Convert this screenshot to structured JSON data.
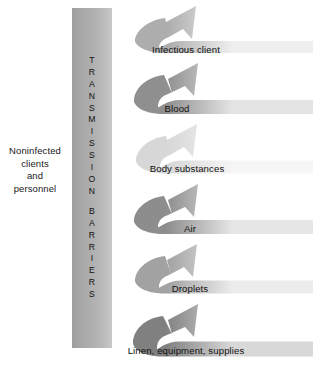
{
  "figure": {
    "type": "barrier-deflection-diagram",
    "background_color": "#ffffff"
  },
  "left_caption": {
    "name": "noninfected-clients-and-personnel",
    "lines": [
      "Noninfected",
      "clients",
      "and",
      "personnel"
    ]
  },
  "barrier": {
    "text": "TRANSMISSION BARRIERS",
    "word_one": [
      "T",
      "R",
      "A",
      "N",
      "S",
      "M",
      "I",
      "S",
      "S",
      "I",
      "O",
      "N"
    ],
    "word_two": [
      "B",
      "A",
      "R",
      "R",
      "I",
      "E",
      "R",
      "S"
    ],
    "orientation": "vertical",
    "gradient_from": "#9d9d9d",
    "gradient_to": "#c9c9c9"
  },
  "arrows": [
    {
      "id": "infectious-client",
      "label": "Infectious client",
      "order": 1,
      "color_dark": "#adadad",
      "color_light": "#efefef",
      "label_x": 186,
      "label_y": 49
    },
    {
      "id": "blood",
      "label": "Blood",
      "order": 2,
      "color_dark": "#8f8f8f",
      "color_light": "#e4e4e4",
      "label_x": 177,
      "label_y": 108
    },
    {
      "id": "body-substances",
      "label": "Body substances",
      "order": 3,
      "color_dark": "#d7d7d7",
      "color_light": "#f6f6f6",
      "label_x": 187,
      "label_y": 168
    },
    {
      "id": "air",
      "label": "Air",
      "order": 4,
      "color_dark": "#8d8d8d",
      "color_light": "#e6e6e6",
      "label_x": 190,
      "label_y": 228
    },
    {
      "id": "droplets",
      "label": "Droplets",
      "order": 5,
      "color_dark": "#a2a2a2",
      "color_light": "#ececec",
      "label_x": 190,
      "label_y": 288
    },
    {
      "id": "linen-equipment-supplies",
      "label": "Linen, equipment, supplies",
      "order": 6,
      "color_dark": "#808080",
      "color_light": "#d8d8d8",
      "label_x": 186,
      "label_y": 350
    }
  ]
}
